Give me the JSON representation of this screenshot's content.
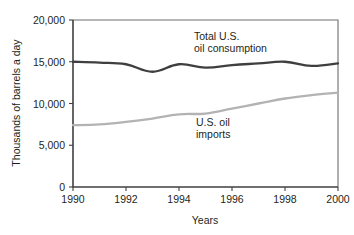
{
  "chart_data": {
    "type": "line",
    "title": "",
    "xlabel": "Years",
    "ylabel": "Thousands of barrels a day",
    "xlim": [
      1990,
      2000
    ],
    "ylim": [
      0,
      20000
    ],
    "grid": false,
    "legend_position": "inline-annotations",
    "x": [
      1990,
      1991,
      1992,
      1993,
      1994,
      1995,
      1996,
      1997,
      1998,
      1999,
      2000
    ],
    "x_tick_labels": [
      "1990",
      "1992",
      "1994",
      "1996",
      "1998",
      "2000"
    ],
    "x_ticks": [
      1990,
      1992,
      1994,
      1996,
      1998,
      2000
    ],
    "y_tick_labels": [
      "0",
      "5,000",
      "10,000",
      "15,000",
      "20,000"
    ],
    "y_ticks": [
      0,
      5000,
      10000,
      15000,
      20000
    ],
    "series": [
      {
        "name": "Total U.S. oil consumption",
        "color": "#3f3f41",
        "values": [
          15000,
          14900,
          14700,
          13800,
          14700,
          14300,
          14600,
          14800,
          15000,
          14500,
          14800
        ]
      },
      {
        "name": "U.S. oil imports",
        "color": "#b3b3b3",
        "values": [
          7400,
          7500,
          7800,
          8200,
          8700,
          8800,
          9400,
          10000,
          10600,
          11000,
          11300
        ]
      }
    ],
    "annotations": [
      {
        "id": "consumption-annotation",
        "lines": [
          "Total U.S.",
          "oil consumption"
        ],
        "x": 1994.0,
        "y": 17400
      },
      {
        "id": "imports-annotation",
        "lines": [
          "U.S. oil",
          "imports"
        ],
        "x": 1994.1,
        "y": 7100
      }
    ]
  }
}
